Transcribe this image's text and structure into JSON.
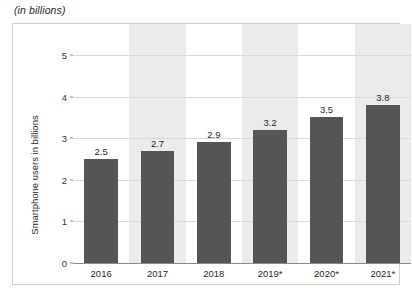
{
  "chart_data": {
    "type": "bar",
    "title": "(in billions)",
    "xlabel": "",
    "ylabel": "Smartphone users in billions",
    "categories": [
      "2016",
      "2017",
      "2018",
      "2019*",
      "2020*",
      "2021*"
    ],
    "values": [
      2.5,
      2.7,
      2.9,
      3.2,
      3.5,
      3.8
    ],
    "value_labels": [
      "2.5",
      "2.7",
      "2.9",
      "3.2",
      "3.5",
      "3.8"
    ],
    "ylim": [
      0,
      5
    ],
    "yticks": [
      0,
      1,
      2,
      3,
      4,
      5
    ],
    "ytick_labels": [
      "0",
      "1",
      "2",
      "3",
      "4",
      "5"
    ],
    "grid": true,
    "legend": null,
    "bar_color": "#555557",
    "band_color": "#ebebeb",
    "gridline_color": "#d9d9d9",
    "axis_color": "#8a8a8a",
    "banded_categories": [
      "2017",
      "2019*",
      "2021*"
    ]
  }
}
